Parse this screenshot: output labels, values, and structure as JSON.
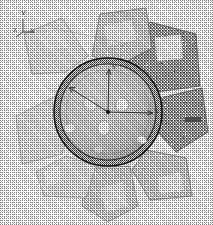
{
  "view": {
    "title": "Engine cooling fan — scanned CAD shaded view",
    "background_color": "#ffffff",
    "ink_color": "#4a4a4a",
    "outline_color": "#1e1e1e",
    "render_style": "dithered halftone grayscale"
  },
  "triad": {
    "name": "coordinate-axis-triad",
    "position": "top-left",
    "labels": {
      "y": "Y",
      "z": "Z",
      "x": "X"
    }
  },
  "center_axes": {
    "name": "hub-center-axis-cross",
    "labels": {
      "y": "Y",
      "x": "X"
    },
    "origin_label": ""
  },
  "part": {
    "name": "cooling-fan",
    "blade_count": 8,
    "hub": {
      "name": "fan-hub-disc",
      "bolt_hole_count": 3,
      "outer_ring": true
    },
    "blades": [
      {
        "id": "blade-1",
        "angle_deg": 12,
        "tone": "dark",
        "highlight": true
      },
      {
        "id": "blade-2",
        "angle_deg": 58,
        "tone": "dark",
        "highlight": false
      },
      {
        "id": "blade-3",
        "angle_deg": 104,
        "tone": "mid",
        "highlight": true
      },
      {
        "id": "blade-4",
        "angle_deg": 150,
        "tone": "mid",
        "highlight": true
      },
      {
        "id": "blade-5",
        "angle_deg": 196,
        "tone": "light",
        "highlight": true
      },
      {
        "id": "blade-6",
        "angle_deg": 242,
        "tone": "light",
        "highlight": false
      },
      {
        "id": "blade-7",
        "angle_deg": 288,
        "tone": "mid",
        "highlight": false
      },
      {
        "id": "blade-8",
        "angle_deg": 334,
        "tone": "dark",
        "highlight": false
      }
    ]
  },
  "edge_mark": {
    "name": "edge-artifact-mark",
    "text": ""
  }
}
